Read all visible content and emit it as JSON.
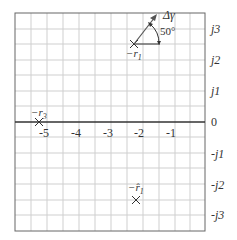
{
  "diagram": {
    "type": "s-plane pole plot",
    "real_axis_ticks": [
      "-5",
      "-4",
      "-3",
      "-2",
      "-1"
    ],
    "imag_axis_ticks": [
      "j3",
      "j2",
      "j1",
      "0",
      "-j1",
      "-j2",
      "-j3"
    ],
    "poles": [
      {
        "label_prefix": "−r",
        "label_sub": "1",
        "re": -2.0,
        "im": 2.5,
        "hat": false
      },
      {
        "label_prefix": "−r",
        "label_sub": "3",
        "re": -5.2,
        "im": 0.0,
        "hat": false
      },
      {
        "label_prefix": "−r̂",
        "label_sub": "1",
        "re": -2.0,
        "im": -2.5,
        "hat": true
      }
    ],
    "annotation": {
      "arrow_label": "Δγ",
      "angle_label": "50°"
    },
    "colors": {
      "grid": "#c8c8c8",
      "border": "#555555",
      "axis": "#333333",
      "arrow": "#555555"
    }
  }
}
